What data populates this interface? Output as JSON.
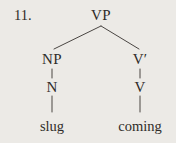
{
  "figure": {
    "item_number": "11.",
    "background_color": "#eceae6",
    "ink_color": "#2f2c29"
  },
  "tree": {
    "type": "syntax-tree",
    "root": "VP",
    "nodes": [
      {
        "id": "vp",
        "label": "VP",
        "x": 101,
        "y": 8,
        "level": 0
      },
      {
        "id": "np",
        "label": "NP",
        "x": 52,
        "y": 52,
        "level": 1
      },
      {
        "id": "vbar",
        "label": "V′",
        "x": 140,
        "y": 52,
        "level": 1
      },
      {
        "id": "n",
        "label": "N",
        "x": 52,
        "y": 80,
        "level": 2
      },
      {
        "id": "v",
        "label": "V",
        "x": 140,
        "y": 80,
        "level": 2
      },
      {
        "id": "slug",
        "label": "slug",
        "x": 52,
        "y": 119,
        "level": 3
      },
      {
        "id": "coming",
        "label": "coming",
        "x": 140,
        "y": 119,
        "level": 3
      }
    ],
    "edges": [
      {
        "from": "vp",
        "to": "np",
        "style": "diagonal"
      },
      {
        "from": "vp",
        "to": "vbar",
        "style": "diagonal"
      },
      {
        "from": "np",
        "to": "n",
        "style": "vertical"
      },
      {
        "from": "vbar",
        "to": "v",
        "style": "vertical"
      },
      {
        "from": "n",
        "to": "slug",
        "style": "vertical"
      },
      {
        "from": "v",
        "to": "coming",
        "style": "vertical"
      }
    ],
    "terminal_string": "slug coming"
  }
}
